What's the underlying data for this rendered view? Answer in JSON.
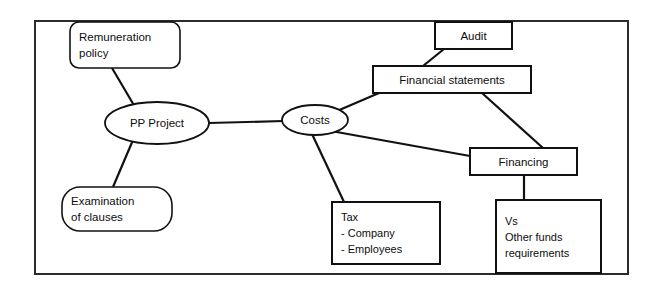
{
  "diagram": {
    "frame": {
      "name": "outer-frame",
      "x": 35,
      "y": 21,
      "width": 593,
      "height": 253,
      "stroke": "#2b2b2b"
    },
    "colors": {
      "background": "#ffffff",
      "stroke": "#111111",
      "frame_stroke": "#2b2b2b",
      "text": "#0d0d0d"
    },
    "nodes": [
      {
        "id": "remuneration-policy",
        "shape": "rounded-rect",
        "lines": [
          "Remuneration",
          "policy"
        ],
        "align": "left",
        "x": 70,
        "y": 22,
        "width": 110,
        "height": 46,
        "radius": 9
      },
      {
        "id": "pp-project",
        "shape": "ellipse",
        "lines": [
          "PP Project"
        ],
        "align": "center",
        "cx": 157,
        "cy": 123,
        "rx": 52,
        "ry": 21
      },
      {
        "id": "examination-of-clauses",
        "shape": "rounded-rect",
        "lines": [
          "Examination",
          "of clauses"
        ],
        "align": "left",
        "x": 62,
        "y": 187,
        "width": 110,
        "height": 44,
        "radius": 18
      },
      {
        "id": "costs",
        "shape": "ellipse",
        "lines": [
          "Costs"
        ],
        "align": "center",
        "cx": 315,
        "cy": 120,
        "rx": 33,
        "ry": 15
      },
      {
        "id": "audit",
        "shape": "rect",
        "lines": [
          "Audit"
        ],
        "align": "center",
        "x": 435,
        "y": 22,
        "width": 77,
        "height": 27
      },
      {
        "id": "financial-statements",
        "shape": "rect",
        "lines": [
          "Financial statements"
        ],
        "align": "center",
        "x": 373,
        "y": 66,
        "width": 158,
        "height": 27
      },
      {
        "id": "financing",
        "shape": "rect",
        "lines": [
          "Financing"
        ],
        "align": "center",
        "x": 470,
        "y": 148,
        "width": 107,
        "height": 27
      },
      {
        "id": "tax",
        "shape": "rect",
        "lines": [
          "Tax",
          "   - Company",
          "   - Employees"
        ],
        "align": "left",
        "x": 332,
        "y": 202,
        "width": 108,
        "height": 62
      },
      {
        "id": "vs-other-funds",
        "shape": "rect",
        "lines": [
          "Vs",
          "Other funds",
          "requirements"
        ],
        "align": "left",
        "x": 496,
        "y": 200,
        "width": 105,
        "height": 73
      }
    ],
    "connectors": [
      {
        "id": "remuneration-to-pp-project",
        "from": "remuneration-policy",
        "to": "pp-project",
        "x1": 112,
        "y1": 68,
        "x2": 135,
        "y2": 107
      },
      {
        "id": "pp-project-to-examination",
        "from": "pp-project",
        "to": "examination-of-clauses",
        "x1": 133,
        "y1": 140,
        "x2": 113,
        "y2": 187
      },
      {
        "id": "pp-project-to-costs",
        "from": "pp-project",
        "to": "costs",
        "x1": 209,
        "y1": 123,
        "x2": 283,
        "y2": 121
      },
      {
        "id": "costs-to-financial-statements",
        "from": "costs",
        "to": "financial-statements",
        "x1": 337,
        "y1": 111,
        "x2": 379,
        "y2": 93
      },
      {
        "id": "costs-to-tax",
        "from": "costs",
        "to": "tax",
        "x1": 312,
        "y1": 134,
        "x2": 344,
        "y2": 202
      },
      {
        "id": "costs-to-financing",
        "from": "costs",
        "to": "financing",
        "x1": 331,
        "y1": 131,
        "x2": 470,
        "y2": 156
      },
      {
        "id": "audit-to-financial-statements",
        "from": "audit",
        "to": "financial-statements",
        "x1": 444,
        "y1": 49,
        "x2": 423,
        "y2": 66
      },
      {
        "id": "financial-statements-to-financing",
        "from": "financial-statements",
        "to": "financing",
        "x1": 482,
        "y1": 93,
        "x2": 543,
        "y2": 148
      },
      {
        "id": "financing-to-vs",
        "from": "financing",
        "to": "vs-other-funds",
        "x1": 524,
        "y1": 175,
        "x2": 524,
        "y2": 200
      }
    ]
  }
}
